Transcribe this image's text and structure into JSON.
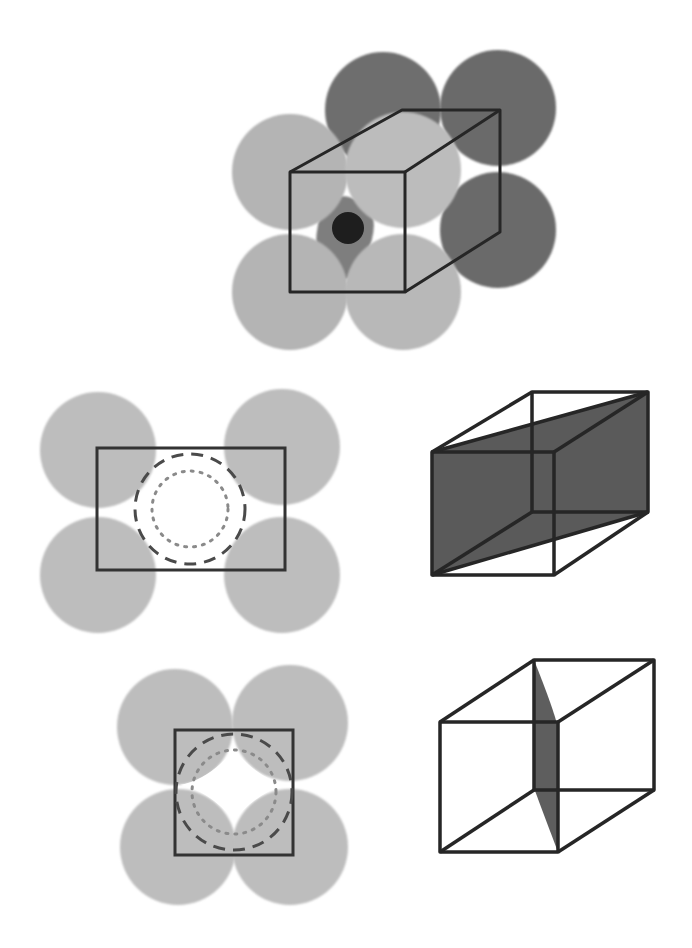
{
  "figure": {
    "colors": {
      "background": "#ffffff",
      "front_sphere": "#b8b8b8",
      "back_sphere": "#6e6e6e",
      "interstitial_atom": "#1e1e1e",
      "interstitial_shadow": "#8a8a8a",
      "cube_edge": "#262626",
      "shaded_plane": "#5a5a5a",
      "section_sphere": "#bdbdbd",
      "dashed_circle": "#4a4a4a",
      "dotted_circle": "#8a8a8a"
    },
    "panels": [
      {
        "id": "unit-cell-3d",
        "label": "Unit cell with 8 corner spheres and interstitial atom"
      },
      {
        "id": "rect-section",
        "label": "Rectangular cross-section through 4 spheres with circular void"
      },
      {
        "id": "diagonal-plane-cube",
        "label": "Cube with shaded diagonal plane"
      },
      {
        "id": "square-section",
        "label": "Square cross-section through 4 spheres with void"
      },
      {
        "id": "edge-plane-cube",
        "label": "Cube with thin shaded plane through edges"
      }
    ]
  }
}
